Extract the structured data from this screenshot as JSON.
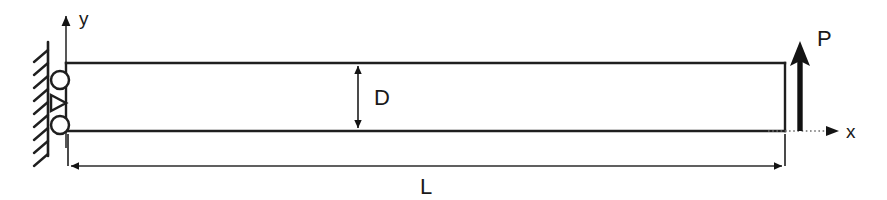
{
  "figure": {
    "type": "engineering-free-body-diagram",
    "background_color": "#ffffff",
    "line_color": "#1f1f1f"
  },
  "axes": {
    "y_axis": {
      "label": "y",
      "direction": "up",
      "label_x": 79,
      "label_y": 24
    },
    "x_axis": {
      "label": "x",
      "direction": "right",
      "style": "dotted",
      "label_x": 846,
      "label_y": 138
    },
    "origin_x": 66,
    "origin_y": 131
  },
  "beam": {
    "name": "beam",
    "left": 66,
    "top": 63,
    "right": 785,
    "bottom": 131
  },
  "support": {
    "type": "fixed-wall-with-rollers",
    "wall_x": 48,
    "wall_top": 42,
    "wall_bottom": 156,
    "hatch_count": 9,
    "rollers": [
      {
        "cx": 60,
        "cy": 80,
        "r": 9
      },
      {
        "cx": 60,
        "cy": 125,
        "r": 9
      }
    ],
    "pin": {
      "cx": 60,
      "cy": 103,
      "size": 11
    }
  },
  "dimensions": [
    {
      "name": "depth",
      "label": "D",
      "orientation": "vertical",
      "x": 358,
      "from": 63,
      "to": 131,
      "label_x": 374,
      "label_y": 105
    },
    {
      "name": "length",
      "label": "L",
      "orientation": "horizontal",
      "y": 166,
      "from": 68,
      "to": 785,
      "label_x": 420,
      "label_y": 193
    }
  ],
  "load": {
    "name": "point-load",
    "label": "P",
    "direction": "up",
    "x": 800,
    "tail_y": 131,
    "head_y": 44,
    "label_x": 817,
    "label_y": 44
  }
}
